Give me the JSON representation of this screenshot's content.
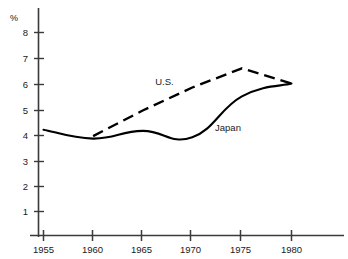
{
  "chart_data": {
    "type": "line",
    "title": "",
    "xlabel": "",
    "ylabel": "%",
    "x": [
      1955,
      1960,
      1965,
      1970,
      1975,
      1980
    ],
    "categories": [
      "1955",
      "1960",
      "1965",
      "1970",
      "1975",
      "1980"
    ],
    "xlim": [
      1953,
      1982
    ],
    "ylim": [
      0,
      8.6
    ],
    "yticks": [
      1,
      2,
      3,
      4,
      5,
      6,
      7,
      8
    ],
    "ytick_labels": [
      "1",
      "2",
      "3",
      "4",
      "5",
      "6",
      "7",
      "8"
    ],
    "xticks": [
      1955,
      1960,
      1965,
      1970,
      1975,
      1980
    ],
    "xtick_labels": [
      "1955",
      "1960",
      "1965",
      "1970",
      "1975",
      "1980"
    ],
    "grid": false,
    "legend_position": "inline-annotation",
    "series": [
      {
        "name": "U.S.",
        "style": "dashed",
        "color": "#000000",
        "x": [
          1960,
          1965,
          1970,
          1975,
          1980
        ],
        "values": [
          3.95,
          4.95,
          5.85,
          6.6,
          6.0
        ],
        "label": "U.S.",
        "label_x": 1967.2,
        "label_y": 6.05
      },
      {
        "name": "Japan",
        "style": "solid",
        "color": "#000000",
        "x": [
          1955,
          1960,
          1965,
          1970,
          1975,
          1980
        ],
        "values": [
          4.2,
          3.85,
          4.15,
          3.9,
          5.5,
          6.0
        ],
        "label": "Japan",
        "label_x": 1973.6,
        "label_y": 4.25
      }
    ],
    "annotations": [
      {
        "text": "U.S.",
        "series": "U.S."
      },
      {
        "text": "Japan",
        "series": "Japan"
      }
    ],
    "axis_color": "#3a3a3a",
    "line_color": "#000000"
  },
  "axes": {
    "y_axis_unit_label": "%",
    "y_tick_labels": [
      "8",
      "7",
      "6",
      "5",
      "4",
      "3",
      "2",
      "1"
    ],
    "x_tick_labels": [
      "1955",
      "1960",
      "1965",
      "1970",
      "1975",
      "1980"
    ]
  },
  "labels": {
    "us": "U.S.",
    "japan": "Japan"
  }
}
